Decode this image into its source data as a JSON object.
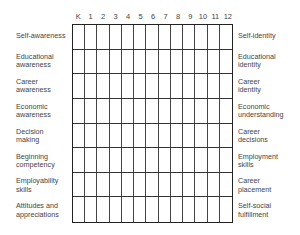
{
  "columns": [
    "K",
    "1",
    "2",
    "3",
    "4",
    "5",
    "6",
    "7",
    "8",
    "9",
    "10",
    "11",
    "12"
  ],
  "rows": [
    {
      "left": "Self-awareness",
      "right": "Self-identity"
    },
    {
      "left": "Educational\nawareness",
      "right": "Educational\nidentity"
    },
    {
      "left": "Career\nawareness",
      "right": "Career\nidentity"
    },
    {
      "left": "Economic\nawareness",
      "right": "Economic\nunderstanding"
    },
    {
      "left": "Decision\nmaking",
      "right": "Career\ndecisions"
    },
    {
      "left": "Beginning\ncompetency",
      "right": "Employment\nskills"
    },
    {
      "left": "Employability\nskills",
      "right": "Career\nplacement"
    },
    {
      "left": "Attitudes and\nappreciations",
      "right": "Self-social\nfulfillment"
    }
  ],
  "colors": {
    "grid_line": "#333333",
    "text": "#444444",
    "background": "#ffffff"
  }
}
